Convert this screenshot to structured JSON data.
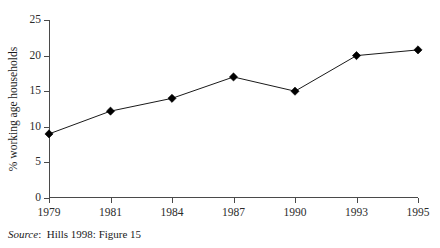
{
  "chart_data": {
    "type": "line",
    "title": "",
    "xlabel": "",
    "ylabel": "% working age households",
    "categories": [
      "1979",
      "1981",
      "1984",
      "1987",
      "1990",
      "1993",
      "1995"
    ],
    "values": [
      9.0,
      12.2,
      14.0,
      17.0,
      15.0,
      20.0,
      20.8
    ],
    "series": [
      {
        "name": "% working age households",
        "values": [
          9.0,
          12.2,
          14.0,
          17.0,
          15.0,
          20.0,
          20.8
        ]
      }
    ],
    "ylim": [
      0,
      25
    ],
    "yticks": [
      0,
      5,
      10,
      15,
      20,
      25
    ],
    "ytick_labels": [
      "0",
      "5",
      "10",
      "15",
      "20",
      "25"
    ],
    "xtick_labels": [
      "1979",
      "1981",
      "1984",
      "1987",
      "1990",
      "1993",
      "1995"
    ],
    "grid": false,
    "legend": "none",
    "marker": "diamond",
    "line_color": "#1a1a1a",
    "marker_color": "#000000",
    "axis_color": "#4a4a4a",
    "background": "#ffffff"
  },
  "caption": {
    "source_label": "Source",
    "source_separator": ":",
    "source_text": "Hills 1998: Figure 15"
  }
}
